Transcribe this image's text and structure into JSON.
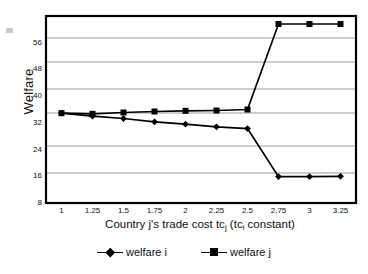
{
  "chart_data": {
    "type": "line",
    "title": "",
    "xlabel": "Country j's trade cost tcj  (tci constant)",
    "ylabel": "Welfare",
    "x": [
      1,
      1.25,
      1.5,
      1.75,
      2,
      2.25,
      2.5,
      2.75,
      3,
      3.25
    ],
    "xtick_labels": [
      "1",
      "1.25",
      "1.5",
      "1.75",
      "2",
      "2.25",
      "2.5",
      "2.75",
      "3",
      "3.25"
    ],
    "ytick_labels": [
      "8",
      "16",
      "24",
      "32",
      "40",
      "48",
      "56"
    ],
    "yticks": [
      8,
      16,
      24,
      32,
      40,
      48,
      56
    ],
    "ylim": [
      8,
      64
    ],
    "xlim": [
      0.875,
      3.375
    ],
    "grid": "horizontal",
    "legend_position": "bottom",
    "series": [
      {
        "name": "welfare i",
        "marker": "diamond",
        "values": [
          34.9,
          34.0,
          33.3,
          32.3,
          31.6,
          30.8,
          30.3,
          15.9,
          15.9,
          16.0
        ]
      },
      {
        "name": "welfare j",
        "marker": "square",
        "values": [
          34.9,
          34.7,
          35.1,
          35.4,
          35.6,
          35.7,
          36.0,
          61.6,
          61.6,
          61.6
        ]
      }
    ]
  },
  "axes": {
    "y_title": "Welfare",
    "x_title_prefix": "Country j's trade cost tc",
    "x_title_sub1": "j",
    "x_title_mid": "  (tc",
    "x_title_sub2": "i",
    "x_title_suffix": " constant)"
  },
  "legend": {
    "items": [
      {
        "label": "welfare i",
        "marker": "diamond"
      },
      {
        "label": "welfare j",
        "marker": "square"
      }
    ]
  },
  "colors": {
    "series_line": "#000000",
    "grid": "#9a9a9a",
    "frame": "#000000",
    "background": "#ffffff",
    "text": "#111111"
  }
}
